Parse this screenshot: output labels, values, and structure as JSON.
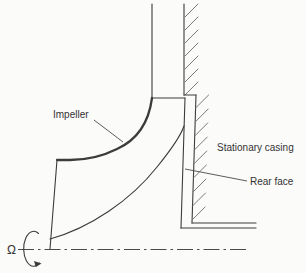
{
  "diagram": {
    "type": "technical-cross-section",
    "labels": {
      "impeller": "Impeller",
      "stationary_casing": "Stationary casing",
      "rear_face": "Rear face",
      "rotation_symbol": "Ω"
    },
    "colors": {
      "line": "#3c3c3c",
      "hatch": "#7a7a7a",
      "text": "#333333",
      "background": "#fbfbfa"
    },
    "centerline_style": "dash-dot",
    "rotation_axis": "horizontal centerline at bottom with omega rotation arrow"
  }
}
